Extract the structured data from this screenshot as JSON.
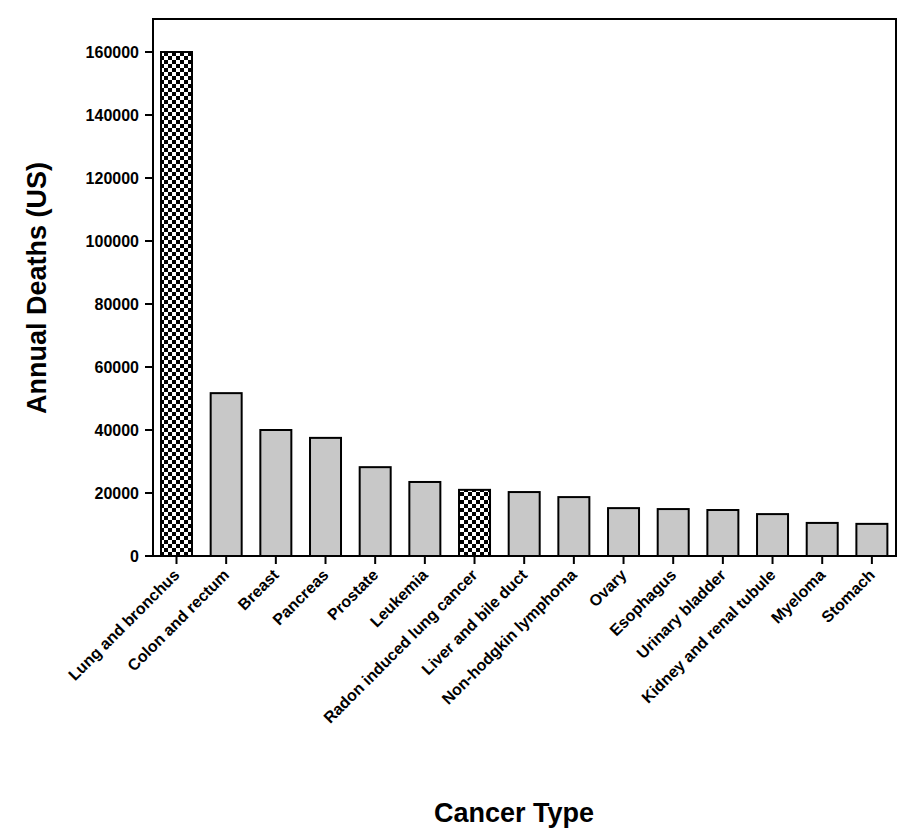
{
  "chart_data": {
    "type": "bar",
    "title": "",
    "xlabel": "Cancer Type",
    "ylabel": "Annual Deaths (US)",
    "ylim": [
      0,
      170000
    ],
    "yticks": [
      0,
      20000,
      40000,
      60000,
      80000,
      100000,
      120000,
      140000,
      160000
    ],
    "ytick_labels": [
      "0",
      "20000",
      "40000",
      "60000",
      "80000",
      "100000",
      "120000",
      "140000",
      "160000"
    ],
    "grid": false,
    "legend": null,
    "categories": [
      "Lung and bronchus",
      "Colon and rectum",
      "Breast",
      "Pancreas",
      "Prostate",
      "Leukemia",
      "Radon induced lung cancer",
      "Liver and bile duct",
      "Non-hodgkin lymphoma",
      "Ovary",
      "Esophagus",
      "Urinary bladder",
      "Kidney and renal tubule",
      "Myeloma",
      "Stomach"
    ],
    "values": [
      160000,
      51700,
      40000,
      37500,
      28200,
      23500,
      21000,
      20300,
      18700,
      15200,
      14900,
      14600,
      13300,
      10500,
      10200
    ],
    "bar_styles": [
      "checker",
      "gray",
      "gray",
      "gray",
      "gray",
      "gray",
      "checker",
      "gray",
      "gray",
      "gray",
      "gray",
      "gray",
      "gray",
      "gray",
      "gray"
    ]
  },
  "colors": {
    "bar_fill": "#c8c8c8",
    "bar_stroke": "#000000",
    "checker_dark": "#000000",
    "checker_light": "#ffffff",
    "axis": "#000000",
    "background": "#ffffff"
  }
}
